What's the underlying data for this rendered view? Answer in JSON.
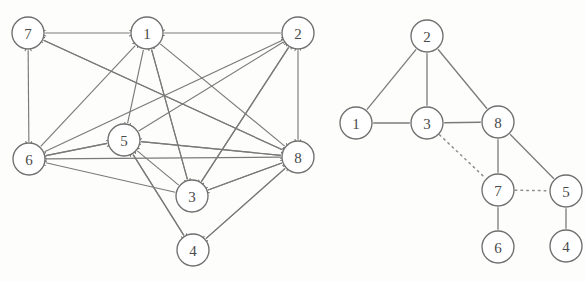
{
  "figure": {
    "background_color": "#fdfdfc",
    "node_stroke_color": "#6f6f6f",
    "edge_color": "#7a7a7a",
    "dotted_edge_color": "#8d8d8d",
    "node_radius": 16
  },
  "panels": [
    {
      "id": "left-panel",
      "name": "directed-graph",
      "type": "directed",
      "nodes": [
        {
          "id": "7",
          "label": "7",
          "x": 28,
          "y": 33
        },
        {
          "id": "1",
          "label": "1",
          "x": 147,
          "y": 33
        },
        {
          "id": "2",
          "label": "2",
          "x": 298,
          "y": 33
        },
        {
          "id": "6",
          "label": "6",
          "x": 29,
          "y": 159
        },
        {
          "id": "5",
          "label": "5",
          "x": 124,
          "y": 140
        },
        {
          "id": "8",
          "label": "8",
          "x": 298,
          "y": 157
        },
        {
          "id": "3",
          "label": "3",
          "x": 192,
          "y": 196
        },
        {
          "id": "4",
          "label": "4",
          "x": 193,
          "y": 250
        }
      ],
      "edges": [
        {
          "from": "7",
          "to": "1",
          "arrow": "both"
        },
        {
          "from": "2",
          "to": "1",
          "arrow": "to"
        },
        {
          "from": "7",
          "to": "6",
          "arrow": "both"
        },
        {
          "from": "2",
          "to": "8",
          "arrow": "both"
        },
        {
          "from": "1",
          "to": "5",
          "arrow": "to"
        },
        {
          "from": "8",
          "to": "7",
          "arrow": "to"
        },
        {
          "from": "8",
          "to": "6",
          "arrow": "to"
        },
        {
          "from": "5",
          "to": "6",
          "arrow": "to"
        },
        {
          "from": "3",
          "to": "6",
          "arrow": "to"
        },
        {
          "from": "6",
          "to": "5",
          "arrow": "to"
        },
        {
          "from": "6",
          "to": "2",
          "arrow": "to"
        },
        {
          "from": "6",
          "to": "1",
          "arrow": "to"
        },
        {
          "from": "8",
          "to": "5",
          "arrow": "to"
        },
        {
          "from": "3",
          "to": "5",
          "arrow": "to"
        },
        {
          "from": "5",
          "to": "2",
          "arrow": "to"
        },
        {
          "from": "5",
          "to": "8",
          "arrow": "to"
        },
        {
          "from": "3",
          "to": "1",
          "arrow": "to"
        },
        {
          "from": "3",
          "to": "2",
          "arrow": "to"
        },
        {
          "from": "3",
          "to": "8",
          "arrow": "to"
        },
        {
          "from": "8",
          "to": "3",
          "arrow": "to"
        },
        {
          "from": "1",
          "to": "3",
          "arrow": "to"
        },
        {
          "from": "2",
          "to": "3",
          "arrow": "to"
        },
        {
          "from": "7",
          "to": "8",
          "arrow": "to"
        },
        {
          "from": "4",
          "to": "8",
          "arrow": "to"
        },
        {
          "from": "8",
          "to": "4",
          "arrow": "to"
        },
        {
          "from": "5",
          "to": "4",
          "arrow": "to"
        },
        {
          "from": "4",
          "to": "5",
          "arrow": "to"
        },
        {
          "from": "1",
          "to": "8",
          "arrow": "to"
        }
      ]
    },
    {
      "id": "right-panel",
      "name": "undirected-graph",
      "type": "undirected",
      "nodes": [
        {
          "id": "2",
          "label": "2",
          "x": 427,
          "y": 36
        },
        {
          "id": "1",
          "label": "1",
          "x": 356,
          "y": 123
        },
        {
          "id": "3",
          "label": "3",
          "x": 427,
          "y": 123
        },
        {
          "id": "8",
          "label": "8",
          "x": 498,
          "y": 122
        },
        {
          "id": "7",
          "label": "7",
          "x": 498,
          "y": 190
        },
        {
          "id": "5",
          "label": "5",
          "x": 566,
          "y": 191
        },
        {
          "id": "6",
          "label": "6",
          "x": 498,
          "y": 247
        },
        {
          "id": "4",
          "label": "4",
          "x": 566,
          "y": 246
        }
      ],
      "edges": [
        {
          "from": "2",
          "to": "1",
          "style": "solid"
        },
        {
          "from": "2",
          "to": "3",
          "style": "solid"
        },
        {
          "from": "2",
          "to": "8",
          "style": "solid"
        },
        {
          "from": "1",
          "to": "3",
          "style": "solid"
        },
        {
          "from": "3",
          "to": "8",
          "style": "solid"
        },
        {
          "from": "3",
          "to": "7",
          "style": "dotted"
        },
        {
          "from": "8",
          "to": "7",
          "style": "solid"
        },
        {
          "from": "8",
          "to": "5",
          "style": "solid"
        },
        {
          "from": "7",
          "to": "5",
          "style": "dotted"
        },
        {
          "from": "7",
          "to": "6",
          "style": "solid"
        },
        {
          "from": "5",
          "to": "4",
          "style": "solid"
        }
      ]
    }
  ]
}
